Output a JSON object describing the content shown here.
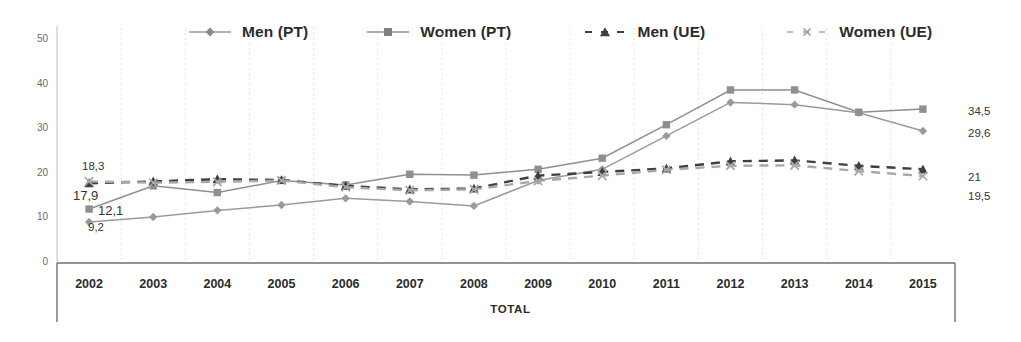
{
  "chart_data": {
    "type": "line",
    "title": "",
    "subtitle": "",
    "xlabel": "TOTAL",
    "ylabel": "",
    "ylim": [
      0,
      50
    ],
    "yticks": [
      0,
      10,
      20,
      30,
      40,
      50
    ],
    "grid": "vertical-only",
    "legend_position": "top",
    "decimal_separator": ",",
    "categories": [
      "2002",
      "2003",
      "2004",
      "2005",
      "2006",
      "2007",
      "2008",
      "2009",
      "2010",
      "2011",
      "2012",
      "2013",
      "2014",
      "2015"
    ],
    "series": [
      {
        "name": "Men (PT)",
        "style": "solid",
        "marker": "diamond",
        "color": "#9a9a9a",
        "values": [
          9.2,
          10.3,
          11.8,
          13.0,
          14.5,
          13.8,
          12.8,
          18.5,
          21.0,
          28.5,
          36.0,
          35.5,
          33.7,
          29.6
        ]
      },
      {
        "name": "Women (PT)",
        "style": "solid",
        "marker": "square",
        "color": "#8f8f8f",
        "values": [
          12.1,
          17.3,
          15.8,
          18.5,
          17.5,
          19.9,
          19.7,
          21.0,
          23.5,
          31.0,
          38.8,
          38.8,
          33.8,
          34.5
        ]
      },
      {
        "name": "Men (UE)",
        "style": "dashed",
        "marker": "triangle",
        "color": "#3f3f3f",
        "values": [
          17.9,
          18.3,
          18.8,
          18.6,
          17.3,
          16.5,
          16.7,
          19.6,
          20.4,
          21.2,
          22.8,
          23.0,
          21.8,
          21.0
        ]
      },
      {
        "name": "Women (UE)",
        "style": "dashed",
        "marker": "x",
        "color": "#a8a8a8",
        "values": [
          18.3,
          18.0,
          18.2,
          18.5,
          17.0,
          16.3,
          16.5,
          18.4,
          19.6,
          20.9,
          21.8,
          21.9,
          20.6,
          19.5
        ]
      }
    ],
    "point_labels": [
      {
        "text": "18,3",
        "series": "Women (UE)",
        "category": "2002",
        "value": 18.3,
        "x": 82,
        "y": 160
      },
      {
        "text": "17,9",
        "series": "Men (UE)",
        "category": "2002",
        "value": 17.9,
        "x": 73,
        "y": 188
      },
      {
        "text": "12,1",
        "series": "Women (PT)",
        "category": "2002",
        "value": 12.1,
        "x": 98,
        "y": 203
      },
      {
        "text": "9,2",
        "series": "Men (PT)",
        "category": "2002",
        "value": 9.2,
        "x": 88,
        "y": 221
      },
      {
        "text": "34,5",
        "series": "Women (PT)",
        "category": "2015",
        "value": 34.5,
        "x": 968,
        "y": 105
      },
      {
        "text": "29,6",
        "series": "Men (PT)",
        "category": "2015",
        "value": 29.6,
        "x": 968,
        "y": 127
      },
      {
        "text": "21",
        "series": "Men (UE)",
        "category": "2015",
        "value": 21.0,
        "x": 968,
        "y": 171
      },
      {
        "text": "19,5",
        "series": "Women (UE)",
        "category": "2015",
        "value": 19.5,
        "x": 968,
        "y": 190
      }
    ]
  },
  "legend": {
    "items": [
      {
        "label": "Men (PT)",
        "key": "line-diamond-key-icon"
      },
      {
        "label": "Women (PT)",
        "key": "line-square-key-icon"
      },
      {
        "label": "Men (UE)",
        "key": "dashed-triangle-key-icon"
      },
      {
        "label": "Women (UE)",
        "key": "dashed-x-key-icon"
      }
    ]
  },
  "axes": {
    "y_ticks": [
      "50",
      "40",
      "30",
      "20",
      "10",
      "0"
    ],
    "x_ticks": [
      "2002",
      "2003",
      "2004",
      "2005",
      "2006",
      "2007",
      "2008",
      "2009",
      "2010",
      "2011",
      "2012",
      "2013",
      "2014",
      "2015"
    ],
    "x_axis_title": "TOTAL"
  }
}
